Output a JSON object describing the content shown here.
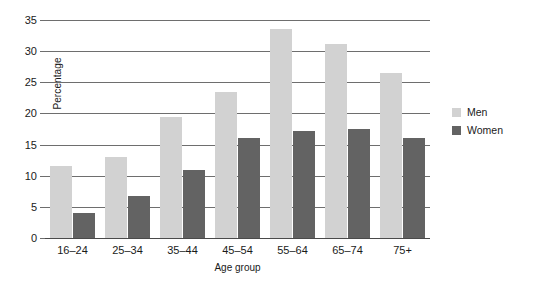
{
  "chart_data": {
    "type": "bar",
    "title": "",
    "xlabel": "Age group",
    "ylabel": "Percentage",
    "categories": [
      "16–24",
      "25–34",
      "35–44",
      "45–54",
      "55–64",
      "65–74",
      "75+"
    ],
    "series": [
      {
        "name": "Men",
        "color": "#d2d2d2",
        "values": [
          11.5,
          13.0,
          19.5,
          23.5,
          33.5,
          31.2,
          26.5
        ]
      },
      {
        "name": "Women",
        "color": "#636363",
        "values": [
          4.0,
          6.7,
          11.0,
          16.0,
          17.2,
          17.5,
          16.0
        ]
      }
    ],
    "ylim": [
      0,
      35
    ],
    "ytick_step": 5,
    "ytick_labels": [
      "0",
      "5",
      "10",
      "15",
      "20",
      "25",
      "30",
      "35"
    ],
    "grid": true,
    "legend_position": "right"
  },
  "legend": {
    "items": [
      {
        "label": "Men"
      },
      {
        "label": "Women"
      }
    ]
  }
}
